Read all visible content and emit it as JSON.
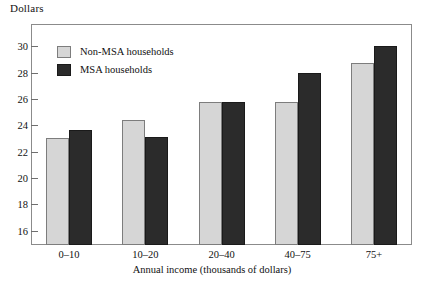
{
  "chart_data": {
    "type": "bar",
    "title": "",
    "ylabel": "Dollars",
    "xlabel": "Annual income (thousands of dollars)",
    "categories": [
      "0–10",
      "10–20",
      "20–40",
      "40–75",
      "75+"
    ],
    "series": [
      {
        "name": "Non-MSA households",
        "color": "#d6d6d6",
        "values": [
          23.0,
          24.4,
          25.8,
          25.75,
          28.7
        ]
      },
      {
        "name": "MSA households",
        "color": "#2b2b2b",
        "values": [
          23.65,
          23.1,
          25.8,
          28.0,
          30.0
        ]
      }
    ],
    "ylim": [
      14.9,
      31.7
    ],
    "yticks": [
      16,
      18,
      20,
      22,
      24,
      26,
      28,
      30
    ],
    "ytick_labels": [
      "16",
      "18",
      "20",
      "22",
      "24",
      "26",
      "28",
      "30"
    ],
    "grid": false,
    "legend_position": "upper-left-inside",
    "frame": true
  },
  "legend": {
    "items": [
      {
        "label": "Non-MSA households",
        "swatch": "light"
      },
      {
        "label": "MSA households",
        "swatch": "dark"
      }
    ]
  }
}
